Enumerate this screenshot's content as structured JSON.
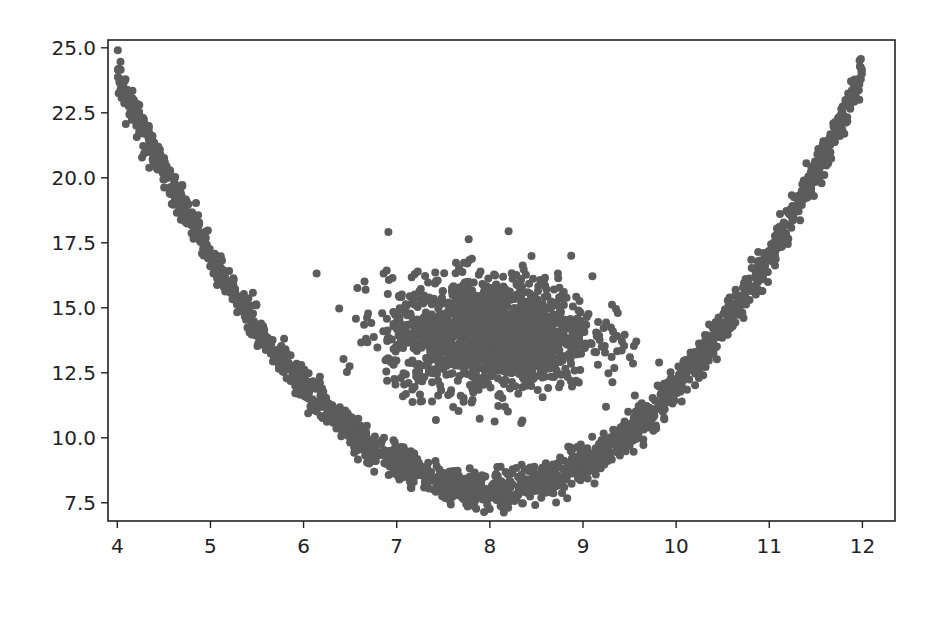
{
  "chart_data": {
    "type": "scatter",
    "title": "",
    "xlabel": "",
    "ylabel": "",
    "xlim": [
      3.9,
      12.35
    ],
    "ylim": [
      6.8,
      25.3
    ],
    "xticks": [
      4,
      5,
      6,
      7,
      8,
      9,
      10,
      11,
      12
    ],
    "xtick_labels": [
      "4",
      "5",
      "6",
      "7",
      "8",
      "9",
      "10",
      "11",
      "12"
    ],
    "yticks": [
      7.5,
      10.0,
      12.5,
      15.0,
      17.5,
      20.0,
      22.5,
      25.0
    ],
    "ytick_labels": [
      "7.5",
      "10.0",
      "12.5",
      "15.0",
      "17.5",
      "20.0",
      "22.5",
      "25.0"
    ],
    "grid": false,
    "legend": null,
    "marker_color": "#5c5c5c",
    "marker_radius_px": 4,
    "series": [
      {
        "name": "parabola-band",
        "description": "Points along y = (x - 8)^2 + 8 with noise, x in [4, 12]",
        "x_range": [
          4,
          12
        ],
        "curve": {
          "a": 1.0,
          "h": 8.0,
          "k": 8.0
        },
        "y_noise_sd": 0.35,
        "count": 2000,
        "sample_points": [
          [
            4.0,
            24.0
          ],
          [
            5.0,
            17.0
          ],
          [
            6.0,
            12.0
          ],
          [
            7.0,
            9.0
          ],
          [
            8.0,
            8.0
          ],
          [
            9.0,
            9.0
          ],
          [
            10.0,
            12.0
          ],
          [
            11.0,
            17.0
          ],
          [
            12.0,
            24.0
          ]
        ]
      },
      {
        "name": "gaussian-blob",
        "description": "Normally distributed cluster centered near (8, 14)",
        "center": [
          8.0,
          14.0
        ],
        "sd": [
          0.55,
          1.1
        ],
        "count": 1500,
        "extent_x": [
          6.9,
          9.8
        ],
        "extent_y": [
          10.4,
          18.0
        ]
      }
    ]
  }
}
